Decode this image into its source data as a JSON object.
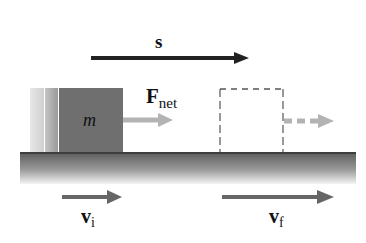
{
  "diagram": {
    "displacement_label": "s",
    "net_force_label": "F",
    "net_force_subscript": "net",
    "mass_label": "m",
    "initial_velocity_label": "v",
    "initial_velocity_subscript": "i",
    "final_velocity_label": "v",
    "final_velocity_subscript": "f",
    "colors": {
      "block": "#6f6f6f",
      "ground_top": "#5a5a5a",
      "ground_bottom": "#f2f2f2",
      "arrow_dark": "#222222",
      "arrow_velocity": "#666666",
      "arrow_force": "#b3b3b3",
      "dashed_outline": "#555555"
    }
  }
}
